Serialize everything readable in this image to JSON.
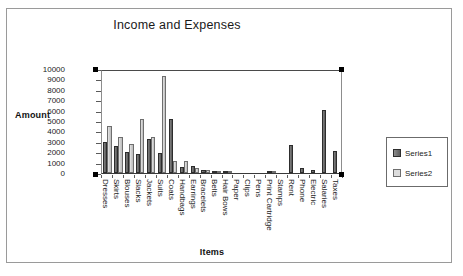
{
  "chart_data": {
    "type": "bar",
    "title": "Income and Expenses",
    "xlabel": "Items",
    "ylabel": "Amount",
    "ylim": [
      0,
      10000
    ],
    "yticks": [
      10000,
      9000,
      8000,
      7000,
      6000,
      5000,
      4000,
      3000,
      2000,
      1000,
      0
    ],
    "grid": false,
    "legend_position": "right",
    "categories": [
      "Dresses",
      "Skirts",
      "Blouses",
      "Slacks",
      "Jackets",
      "Suits",
      "Coats",
      "Handbags",
      "Earrings",
      "Bracelets",
      "Belts",
      "Hair Bows",
      "Paper",
      "Clips",
      "Pens",
      "Print Cartridge",
      "Stamps",
      "Rent",
      "Phone",
      "Electric",
      "Salaries",
      "Taxes"
    ],
    "series": [
      {
        "name": "Series1",
        "color": "#6f6f6f",
        "values": [
          2950,
          2550,
          2050,
          1800,
          3300,
          1950,
          5150,
          600,
          700,
          250,
          200,
          60,
          0,
          0,
          0,
          120,
          0,
          2650,
          450,
          330,
          6050,
          2100
        ]
      },
      {
        "name": "Series2",
        "color": "#d5d5d5",
        "values": [
          4500,
          3500,
          2750,
          5150,
          3500,
          9300,
          1150,
          1150,
          500,
          300,
          180,
          40,
          0,
          0,
          0,
          60,
          0,
          0,
          0,
          0,
          0,
          0
        ]
      }
    ]
  },
  "legend": {
    "items": [
      {
        "label": "Series1"
      },
      {
        "label": "Series2"
      }
    ]
  }
}
